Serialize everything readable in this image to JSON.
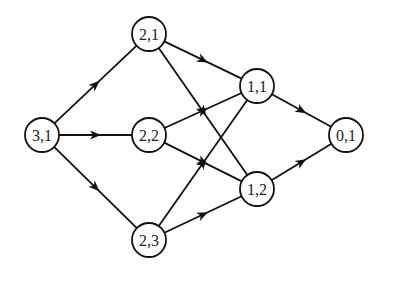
{
  "diagram": {
    "type": "directed-graph",
    "colors": {
      "stroke": "#111111",
      "node_fill": "#ffffff",
      "background": "#ffffff"
    },
    "node_radius": 17,
    "nodes": [
      {
        "id": "n31",
        "label": "3,1",
        "x": 42,
        "y": 135
      },
      {
        "id": "n21",
        "label": "2,1",
        "x": 149,
        "y": 34
      },
      {
        "id": "n22",
        "label": "2,2",
        "x": 149,
        "y": 135
      },
      {
        "id": "n23",
        "label": "2,3",
        "x": 149,
        "y": 240
      },
      {
        "id": "n11",
        "label": "1,1",
        "x": 257,
        "y": 86
      },
      {
        "id": "n12",
        "label": "1,2",
        "x": 257,
        "y": 189
      },
      {
        "id": "n01",
        "label": "0,1",
        "x": 346,
        "y": 135
      }
    ],
    "edges": [
      {
        "from": "n31",
        "to": "n21"
      },
      {
        "from": "n31",
        "to": "n22"
      },
      {
        "from": "n31",
        "to": "n23"
      },
      {
        "from": "n21",
        "to": "n11"
      },
      {
        "from": "n21",
        "to": "n12"
      },
      {
        "from": "n22",
        "to": "n11"
      },
      {
        "from": "n22",
        "to": "n12"
      },
      {
        "from": "n23",
        "to": "n11"
      },
      {
        "from": "n23",
        "to": "n12"
      },
      {
        "from": "n11",
        "to": "n01"
      },
      {
        "from": "n12",
        "to": "n01"
      }
    ]
  }
}
